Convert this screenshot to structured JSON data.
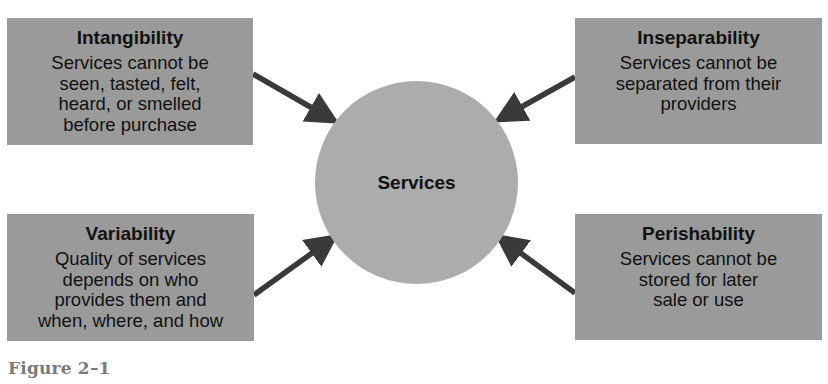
{
  "diagram": {
    "center": {
      "label": "Services"
    },
    "characteristics": [
      {
        "position": "top-left",
        "title": "Intangibility",
        "description": "Services cannot be\nseen, tasted, felt,\nheard, or smelled\nbefore purchase"
      },
      {
        "position": "top-right",
        "title": "Inseparability",
        "description": "Services cannot be\nseparated from their\nproviders"
      },
      {
        "position": "bottom-left",
        "title": "Variability",
        "description": "Quality of services\ndepends on who\nprovides them and\nwhen, where, and how"
      },
      {
        "position": "bottom-right",
        "title": "Perishability",
        "description": "Services cannot be\nstored for later\nsale or use"
      }
    ],
    "caption": "Figure 2–1",
    "colors": {
      "box_fill": "#9a9a9a",
      "circle_fill": "#acacac",
      "arrow": "#3a3a3a",
      "text": "#111111",
      "caption": "#7a7a7a"
    }
  }
}
